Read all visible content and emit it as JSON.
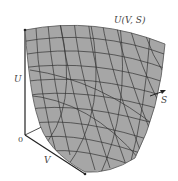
{
  "figure": {
    "title_label": "U(V, S)",
    "axes": {
      "vertical": {
        "label": "U"
      },
      "depth": {
        "label": "V"
      },
      "horizontal": {
        "label": "S"
      },
      "origin": {
        "label": "0"
      }
    }
  },
  "colors": {
    "surface_fill": "#a6a6a6",
    "grid_line": "#333333",
    "axis": "#222222",
    "text": "#444444",
    "background": "#ffffff"
  }
}
